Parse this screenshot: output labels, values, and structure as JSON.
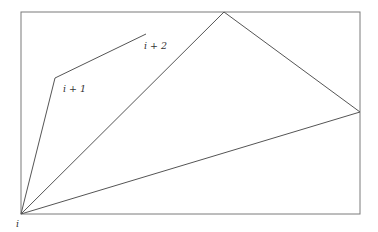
{
  "diagram": {
    "labels": {
      "i": "i",
      "i_plus_1": "i + 1",
      "i_plus_2": "i + 2"
    },
    "colors": {
      "stroke": "#6f6f6f",
      "text": "#333333",
      "background": "#ffffff"
    },
    "points": {
      "i": [
        21,
        214
      ],
      "i_plus_1": [
        55,
        78
      ],
      "i_plus_2": [
        146,
        34
      ],
      "apex": [
        224,
        12
      ],
      "right": [
        360,
        112
      ]
    },
    "frame": {
      "x": 21,
      "y": 12,
      "width": 339,
      "height": 202
    }
  }
}
